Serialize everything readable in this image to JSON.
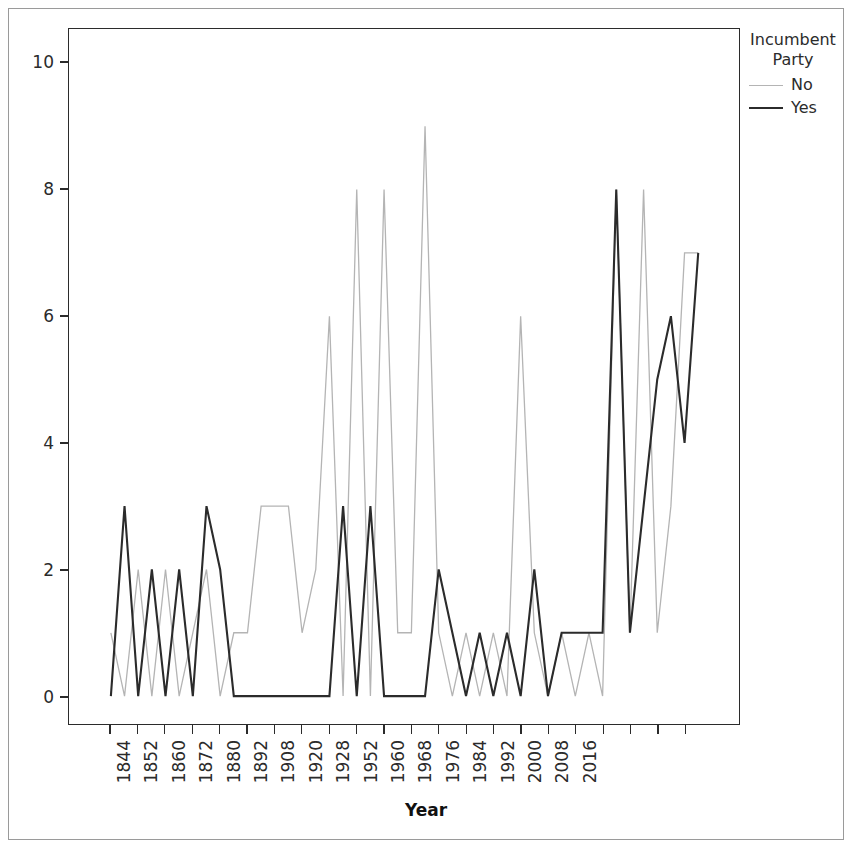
{
  "chart_data": {
    "type": "line",
    "title": "",
    "xlabel": "Year",
    "ylabel": "",
    "ylim": [
      -0.55,
      10.6
    ],
    "yticks": [
      0,
      2,
      4,
      6,
      8,
      10
    ],
    "xticks": [
      "1844",
      "1852",
      "1860",
      "1872",
      "1880",
      "1892",
      "1908",
      "1920",
      "1928",
      "1952",
      "1960",
      "1968",
      "1976",
      "1984",
      "1992",
      "2000",
      "2008",
      "2016"
    ],
    "grid": false,
    "legend_position": "right",
    "legend_title": "Incumbent Party",
    "x": [
      1844,
      1848,
      1852,
      1856,
      1860,
      1864,
      1868,
      1872,
      1876,
      1880,
      1884,
      1888,
      1892,
      1896,
      1900,
      1904,
      1908,
      1912,
      1916,
      1920,
      1924,
      1928,
      1932,
      1936,
      1940,
      1944,
      1948,
      1952,
      1956,
      1960,
      1964,
      1968,
      1972,
      1976,
      1980,
      1984,
      1988,
      1992,
      1996,
      2000,
      2004,
      2008,
      2012,
      2016
    ],
    "series": [
      {
        "name": "No",
        "color": "#b4b4b4",
        "values": [
          1,
          0,
          2,
          0,
          2,
          0,
          1,
          2,
          0,
          1,
          1,
          3,
          3,
          3,
          1,
          2,
          6,
          0,
          8,
          0,
          8,
          1,
          1,
          9,
          1,
          0,
          1,
          0,
          1,
          0,
          6,
          1,
          0,
          1,
          0,
          1,
          0,
          8,
          1,
          8,
          1,
          3,
          7,
          7
        ]
      },
      {
        "name": "Yes",
        "color": "#2b2b2b",
        "values": [
          0,
          3,
          0,
          2,
          0,
          2,
          0,
          3,
          2,
          0,
          0,
          0,
          0,
          0,
          0,
          0,
          0,
          3,
          0,
          3,
          0,
          0,
          0,
          0,
          2,
          1,
          0,
          1,
          0,
          1,
          0,
          2,
          0,
          1,
          1,
          1,
          1,
          8,
          1,
          3,
          5,
          6,
          4,
          7
        ]
      }
    ]
  },
  "axes": {
    "x_title": "Year",
    "y_tick_labels": [
      "0",
      "2",
      "4",
      "6",
      "8",
      "10"
    ],
    "x_tick_labels": [
      "1844",
      "1852",
      "1860",
      "1872",
      "1880",
      "1892",
      "1908",
      "1920",
      "1928",
      "1952",
      "1960",
      "1968",
      "1976",
      "1984",
      "1992",
      "2000",
      "2008",
      "2016"
    ]
  },
  "legend": {
    "title_line1": "Incumbent",
    "title_line2": "Party",
    "entries": [
      {
        "label": "No",
        "color": "#b4b4b4",
        "width": "1.3px"
      },
      {
        "label": "Yes",
        "color": "#2b2b2b",
        "width": "2.2px"
      }
    ]
  }
}
